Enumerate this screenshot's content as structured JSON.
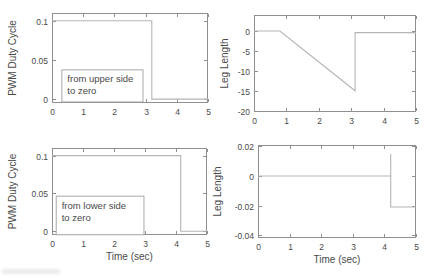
{
  "figure": {
    "background": "#ffffff",
    "colors": {
      "axis": "#8f8f8f",
      "data_line": "#b5b5b5",
      "text": "#4a4a4a",
      "annotation_border": "#a8a8a8",
      "annotation_fill": "#ffffff"
    }
  },
  "chart_data": [
    {
      "type": "line",
      "position": "top-left",
      "title": "",
      "xlabel": "",
      "ylabel": "PWM Duty Cycle",
      "xlim": [
        0,
        5
      ],
      "ylim": [
        -0.005,
        0.11
      ],
      "xticks": [
        0,
        1,
        2,
        3,
        4,
        5
      ],
      "xtick_labels": [
        "0",
        "1",
        "2",
        "3",
        "4",
        "5"
      ],
      "ytick_values": [
        0,
        0.05,
        0.1
      ],
      "ytick_labels": [
        "0",
        "0.05",
        "0.1"
      ],
      "grid": false,
      "legend": null,
      "series": [
        {
          "name": "pwm-upper-step",
          "x": [
            0,
            3.2,
            3.2,
            5
          ],
          "y": [
            0.1,
            0.1,
            0,
            0
          ]
        }
      ],
      "annotation": {
        "lines": [
          "from upper side",
          "to zero"
        ],
        "x0": 0.3,
        "x1": 2.9,
        "y0": -0.003,
        "y1": 0.038
      }
    },
    {
      "type": "line",
      "position": "top-right",
      "title": "",
      "xlabel": "",
      "ylabel": "Leg Length",
      "xlim": [
        0,
        5
      ],
      "ylim": [
        -20.3,
        4
      ],
      "xticks": [
        0,
        1,
        2,
        3,
        4,
        5
      ],
      "xtick_labels": [
        "0",
        "1",
        "2",
        "3",
        "4",
        "5"
      ],
      "ytick_values": [
        0,
        -5,
        -10,
        -15,
        -20
      ],
      "ytick_labels": [
        "0",
        "-5",
        "-10",
        "-15",
        "-20"
      ],
      "grid": false,
      "legend": null,
      "series": [
        {
          "name": "leg-length-upper",
          "x": [
            0,
            0.8,
            3.12,
            3.12,
            5
          ],
          "y": [
            0,
            0,
            -15,
            -0.4,
            -0.4
          ]
        }
      ],
      "annotation": null
    },
    {
      "type": "line",
      "position": "bottom-left",
      "title": "",
      "xlabel": "Time (sec)",
      "ylabel": "PWM Duty Cycle",
      "xlim": [
        0,
        5
      ],
      "ylim": [
        -0.005,
        0.11
      ],
      "xticks": [
        0,
        1,
        2,
        3,
        4,
        5
      ],
      "xtick_labels": [
        "0",
        "1",
        "2",
        "3",
        "4",
        "5"
      ],
      "ytick_values": [
        0,
        0.05,
        0.1
      ],
      "ytick_labels": [
        "0",
        "0.05",
        "0.1"
      ],
      "grid": false,
      "legend": null,
      "series": [
        {
          "name": "pwm-lower-step",
          "x": [
            0,
            4.15,
            4.15,
            5
          ],
          "y": [
            0.1,
            0.1,
            0,
            0
          ]
        }
      ],
      "annotation": {
        "lines": [
          "from lower side",
          "to zero"
        ],
        "x0": 0.12,
        "x1": 2.95,
        "y0": -0.004,
        "y1": 0.047
      }
    },
    {
      "type": "line",
      "position": "bottom-right",
      "title": "",
      "xlabel": "Time (sec)",
      "ylabel": "Leg Length",
      "xlim": [
        0,
        5
      ],
      "ylim": [
        -0.042,
        0.021
      ],
      "xticks": [
        0,
        1,
        2,
        3,
        4,
        5
      ],
      "xtick_labels": [
        "0",
        "1",
        "2",
        "3",
        "4",
        "5"
      ],
      "ytick_values": [
        0.02,
        0,
        -0.02,
        -0.04
      ],
      "ytick_labels": [
        "0.02",
        "0",
        "-0.02",
        "-0.04"
      ],
      "grid": false,
      "legend": null,
      "series": [
        {
          "name": "leg-length-lower",
          "x": [
            0,
            4.2,
            4.2,
            4.2,
            5
          ],
          "y": [
            0,
            0,
            0.015,
            -0.021,
            -0.021
          ]
        }
      ],
      "annotation": null
    }
  ]
}
